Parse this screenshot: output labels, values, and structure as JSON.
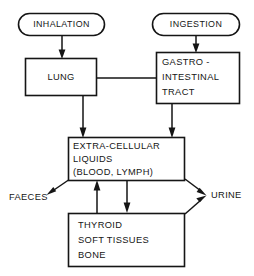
{
  "diagram": {
    "background_color": "#ffffff",
    "line_color": "#151515",
    "nodes": {
      "inhalation": {
        "label": "INHALATION",
        "shape": "rounded-oval"
      },
      "ingestion": {
        "label": "INGESTION",
        "shape": "rounded-oval"
      },
      "lung": {
        "label": "LUNG",
        "shape": "rectangle"
      },
      "gastro_intestinal_tract": {
        "shape": "rectangle",
        "line1": "GASTRO -",
        "line2": "INTESTINAL",
        "line3": "TRACT"
      },
      "extracellular_liquids": {
        "shape": "rectangle",
        "line1": "EXTRA-CELLULAR",
        "line2": "LIQUIDS",
        "line3": "(BLOOD, LYMPH)"
      },
      "tissues": {
        "shape": "rectangle",
        "line1": "THYROID",
        "line2": "SOFT TISSUES",
        "line3": "BONE"
      }
    },
    "outflows": {
      "faeces": "FAECES",
      "urine": "URINE"
    }
  }
}
